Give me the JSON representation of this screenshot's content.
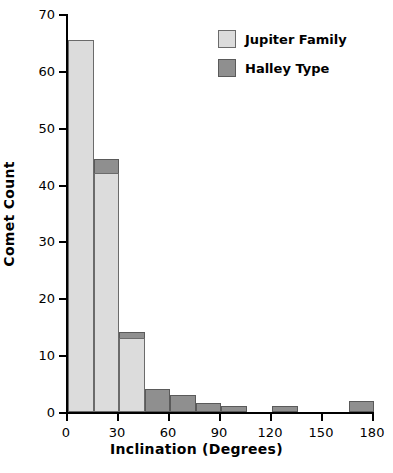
{
  "chart_data": {
    "type": "bar",
    "title": "",
    "xlabel": "Inclination  (Degrees)",
    "ylabel": "Comet Count",
    "xlim": [
      0,
      180
    ],
    "ylim": [
      0,
      70
    ],
    "grid": false,
    "bin_width": 15,
    "legend_position": "top-right",
    "x_ticks": [
      "0",
      "30",
      "60",
      "90",
      "120",
      "150",
      "180"
    ],
    "x_tick_values": [
      0,
      30,
      60,
      90,
      120,
      150,
      180
    ],
    "y_ticks": [
      "0",
      "10",
      "20",
      "30",
      "40",
      "50",
      "60",
      "70"
    ],
    "y_tick_values": [
      0,
      10,
      20,
      30,
      40,
      50,
      60,
      70
    ],
    "bin_starts": [
      0,
      15,
      30,
      45,
      60,
      75,
      90,
      105,
      120,
      135,
      150,
      165
    ],
    "series": [
      {
        "name": "Jupiter Family",
        "color": "#dcdcdc",
        "values": [
          65.5,
          42,
          13,
          0,
          0,
          0,
          0,
          0,
          0,
          0,
          0,
          0
        ]
      },
      {
        "name": "Halley Type",
        "color": "#8f8f8f",
        "values": [
          0,
          44.5,
          14,
          4,
          3,
          1.5,
          1,
          0,
          1,
          0,
          0,
          2
        ]
      }
    ]
  },
  "legend": {
    "items": [
      {
        "label": "Jupiter Family",
        "color": "#dcdcdc"
      },
      {
        "label": "Halley Type",
        "color": "#8f8f8f"
      }
    ]
  }
}
